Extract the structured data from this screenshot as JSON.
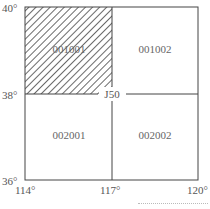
{
  "diagram": {
    "lat_labels": {
      "top": "40°",
      "mid": "38°",
      "bottom": "36°"
    },
    "lon_labels": {
      "left": "114°",
      "mid": "117°",
      "right": "120°"
    },
    "center_label": "J50",
    "cells": [
      {
        "id": "001001",
        "position": "top-left",
        "hatched": true
      },
      {
        "id": "001002",
        "position": "top-right",
        "hatched": false
      },
      {
        "id": "002001",
        "position": "bottom-left",
        "hatched": false
      },
      {
        "id": "002002",
        "position": "bottom-right",
        "hatched": false
      }
    ]
  }
}
